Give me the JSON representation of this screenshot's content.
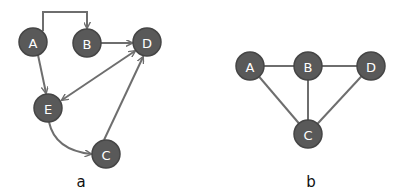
{
  "colors": {
    "node_fill": "#595959",
    "node_stroke": "#454545",
    "node_label": "#ffffff",
    "edge": "#6e6e6e",
    "caption": "#111111",
    "background": "#ffffff"
  },
  "diagrams": [
    {
      "caption": "a",
      "directed": true,
      "nodes": [
        {
          "id": "A",
          "label": "A",
          "x": 33,
          "y": 42
        },
        {
          "id": "B",
          "label": "B",
          "x": 87,
          "y": 43
        },
        {
          "id": "D",
          "label": "D",
          "x": 147,
          "y": 42
        },
        {
          "id": "E",
          "label": "E",
          "x": 48,
          "y": 108
        },
        {
          "id": "C",
          "label": "C",
          "x": 106,
          "y": 154
        }
      ],
      "edges": [
        {
          "from": "A",
          "to": "B",
          "style": "elbow"
        },
        {
          "from": "B",
          "to": "D",
          "style": "straight"
        },
        {
          "from": "A",
          "to": "E",
          "style": "straight"
        },
        {
          "from": "D",
          "to": "E",
          "style": "straight",
          "bidirectional": true
        },
        {
          "from": "E",
          "to": "C",
          "style": "curved"
        },
        {
          "from": "C",
          "to": "D",
          "style": "straight"
        }
      ]
    },
    {
      "caption": "b",
      "directed": false,
      "nodes": [
        {
          "id": "A",
          "label": "A",
          "x": 250,
          "y": 66
        },
        {
          "id": "B",
          "label": "B",
          "x": 308,
          "y": 66
        },
        {
          "id": "D",
          "label": "D",
          "x": 371,
          "y": 66
        },
        {
          "id": "C",
          "label": "C",
          "x": 308,
          "y": 134
        }
      ],
      "edges": [
        {
          "from": "A",
          "to": "B"
        },
        {
          "from": "B",
          "to": "D"
        },
        {
          "from": "A",
          "to": "C"
        },
        {
          "from": "B",
          "to": "C"
        },
        {
          "from": "D",
          "to": "C"
        }
      ]
    }
  ]
}
